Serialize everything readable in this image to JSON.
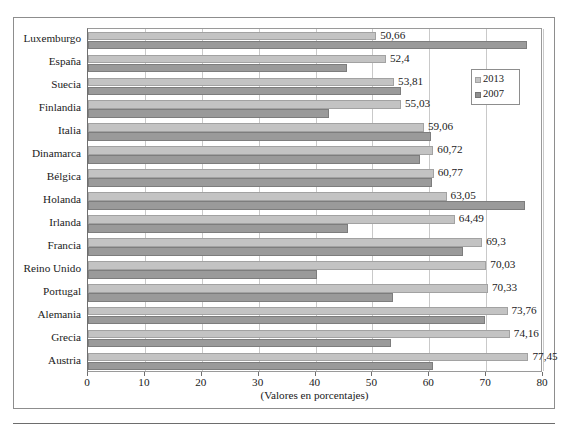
{
  "chart_data": {
    "type": "bar",
    "orientation": "horizontal",
    "title": "",
    "xlabel": "(Valores en porcentajes)",
    "ylabel": "",
    "xlim": [
      0,
      80
    ],
    "xticks": [
      0,
      10,
      20,
      30,
      40,
      50,
      60,
      70,
      80
    ],
    "grid": true,
    "legend_position": "right-top",
    "categories": [
      "Luxemburgo",
      "España",
      "Suecia",
      "Finlandia",
      "Italia",
      "Dinamarca",
      "Bélgica",
      "Holanda",
      "Irlanda",
      "Francia",
      "Reino Unido",
      "Portugal",
      "Alemania",
      "Grecia",
      "Austria"
    ],
    "series": [
      {
        "name": "2013",
        "color": "#c3c3c3",
        "values": [
          50.66,
          52.4,
          53.81,
          55.03,
          59.06,
          60.72,
          60.77,
          63.05,
          64.49,
          69.3,
          70.03,
          70.33,
          73.76,
          74.16,
          77.45
        ],
        "labels": [
          "50,66",
          "52,4",
          "53,81",
          "55,03",
          "59,06",
          "60,72",
          "60,77",
          "63,05",
          "64,49",
          "69,3",
          "70,03",
          "70,33",
          "73,76",
          "74,16",
          "77,45"
        ]
      },
      {
        "name": "2007",
        "color": "#9a9a9a",
        "values": [
          77.2,
          45.6,
          55.1,
          42.4,
          60.3,
          58.3,
          60.5,
          76.9,
          45.7,
          66.0,
          40.2,
          53.6,
          69.8,
          53.2,
          60.6
        ],
        "labels": []
      }
    ]
  },
  "legend": {
    "items": [
      {
        "label": "2013",
        "swatch": "legend-swatch-2013"
      },
      {
        "label": "2007",
        "swatch": "legend-swatch-2007"
      }
    ]
  },
  "axis": {
    "title": "(Valores en porcentajes)",
    "tick_labels": [
      "0",
      "10",
      "20",
      "30",
      "40",
      "50",
      "60",
      "70",
      "80"
    ]
  },
  "caption": {
    "text": ""
  }
}
